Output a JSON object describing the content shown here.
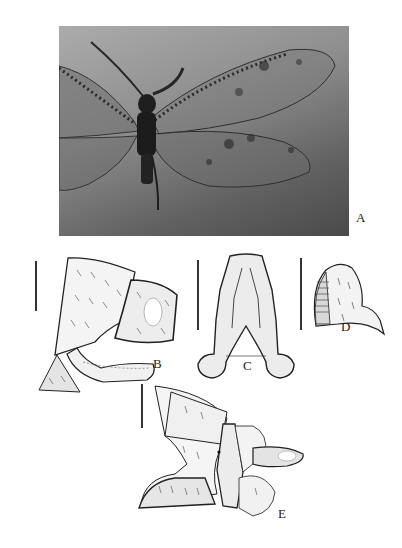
{
  "figure": {
    "panels": [
      {
        "id": "A",
        "label": "A",
        "kind": "photograph",
        "subject": "dorsal habitus of lacewing-like insect with spotted, net-veined wings"
      },
      {
        "id": "B",
        "label": "B",
        "kind": "line-drawing",
        "subject": "male terminalia, lateral view"
      },
      {
        "id": "C",
        "label": "C",
        "kind": "line-drawing",
        "subject": "gonarcus / sclerite, ventral view"
      },
      {
        "id": "D",
        "label": "D",
        "kind": "line-drawing",
        "subject": "ectoproct, lateral view"
      },
      {
        "id": "E",
        "label": "E",
        "kind": "line-drawing",
        "subject": "female terminalia, lateral view"
      }
    ],
    "colors": {
      "background": "#ffffff",
      "photo_light": "#ababab",
      "photo_dark": "#4a4a4a",
      "ink": "#222222"
    }
  }
}
